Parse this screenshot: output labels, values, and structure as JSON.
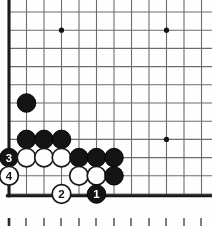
{
  "diagram": {
    "type": "go-game-position",
    "board": {
      "origin_x": 9,
      "origin_y": 12,
      "cell_w": 17.5,
      "cell_h": 18.2,
      "cols": 12,
      "rows": 11,
      "edge_left_thick": true,
      "edge_bottom_thick": true,
      "line_color": "#6d6d6d",
      "edge_color": "#1a1a1a",
      "background": "#ffffff"
    },
    "star_points": [
      {
        "col": 3,
        "row": 1
      },
      {
        "col": 9,
        "row": 1
      },
      {
        "col": 9,
        "row": 7
      }
    ],
    "stones": [
      {
        "col": 1,
        "row": 5,
        "color": "black",
        "label": ""
      },
      {
        "col": 1,
        "row": 7,
        "color": "black",
        "label": ""
      },
      {
        "col": 2,
        "row": 7,
        "color": "black",
        "label": ""
      },
      {
        "col": 3,
        "row": 7,
        "color": "black",
        "label": ""
      },
      {
        "col": 0,
        "row": 8,
        "color": "black",
        "label": "3"
      },
      {
        "col": 1,
        "row": 8,
        "color": "white",
        "label": ""
      },
      {
        "col": 2,
        "row": 8,
        "color": "white",
        "label": ""
      },
      {
        "col": 3,
        "row": 8,
        "color": "white",
        "label": ""
      },
      {
        "col": 4,
        "row": 8,
        "color": "black",
        "label": ""
      },
      {
        "col": 5,
        "row": 8,
        "color": "black",
        "label": ""
      },
      {
        "col": 6,
        "row": 8,
        "color": "black",
        "label": ""
      },
      {
        "col": 0,
        "row": 9,
        "color": "white",
        "label": "4"
      },
      {
        "col": 4,
        "row": 9,
        "color": "white",
        "label": ""
      },
      {
        "col": 5,
        "row": 9,
        "color": "white",
        "label": ""
      },
      {
        "col": 6,
        "row": 9,
        "color": "black",
        "label": ""
      },
      {
        "col": 3,
        "row": 10,
        "color": "white",
        "label": "2"
      },
      {
        "col": 5,
        "row": 10,
        "color": "black",
        "label": "1"
      }
    ],
    "move_labels": [
      "1",
      "2",
      "3",
      "4"
    ],
    "ruler": {
      "y": 218,
      "tick_height": 9,
      "first_tick_bold": true,
      "positions": [
        9,
        26,
        44,
        61,
        79,
        96,
        114,
        131,
        149,
        166,
        184,
        201
      ],
      "color": "#2a2a2a"
    },
    "stone_radius": 9.3,
    "stone_colors": {
      "black_fill": "#141414",
      "black_stroke": "#000000",
      "white_fill": "#ffffff",
      "white_stroke": "#1a1a1a",
      "black_label_text": "#ffffff",
      "white_label_text": "#111111"
    }
  }
}
